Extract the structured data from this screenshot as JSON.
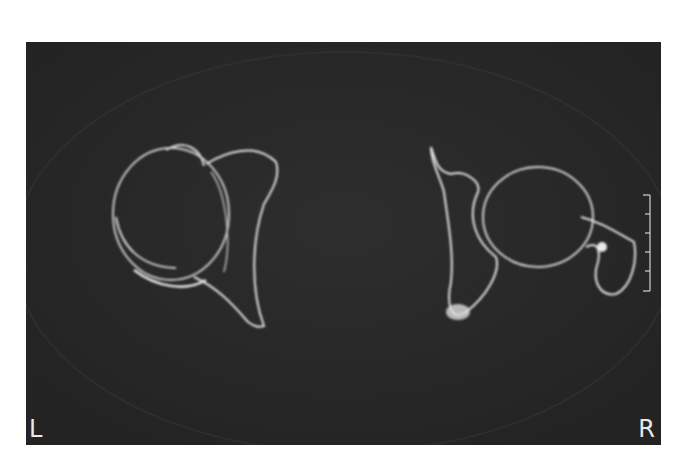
{
  "image": {
    "type": "axial CT scan",
    "background_color": "#ffffff",
    "scan_background_color": "#2a2a2a",
    "bone_color": "#e6e6e6"
  },
  "labels": {
    "left": "L",
    "right": "R"
  },
  "scale_bar": {
    "ticks": 6,
    "position": "right edge"
  }
}
